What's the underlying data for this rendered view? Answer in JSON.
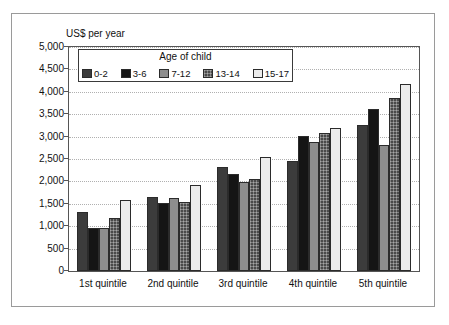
{
  "figure": {
    "axis_title": "US$ per year",
    "legend_title": "Age of child"
  },
  "chart_data": {
    "type": "bar",
    "title": "",
    "xlabel": "",
    "ylabel": "US$ per year",
    "ylim": [
      0,
      5000
    ],
    "ytick_step": 500,
    "grid": true,
    "legend_position": "inside-top-left",
    "legend_title": "Age of child",
    "categories": [
      "1st quintile",
      "2nd quintile",
      "3rd quintile",
      "4th quintile",
      "5th quintile"
    ],
    "ytick_labels": [
      "0",
      "500",
      "1,000",
      "1,500",
      "2,000",
      "2,500",
      "3,000",
      "3,500",
      "4,000",
      "4,500",
      "5,000"
    ],
    "ytick_values": [
      0,
      500,
      1000,
      1500,
      2000,
      2500,
      3000,
      3500,
      4000,
      4500,
      5000
    ],
    "series": [
      {
        "name": "0-2",
        "color": "#3c3c3c",
        "pattern": "solid",
        "values": [
          1320,
          1650,
          2330,
          2460,
          3260
        ]
      },
      {
        "name": "3-6",
        "color": "#151515",
        "pattern": "solid",
        "values": [
          960,
          1510,
          2160,
          3010,
          3620
        ]
      },
      {
        "name": "7-12",
        "color": "#8d8d8d",
        "pattern": "solid",
        "values": [
          960,
          1630,
          1980,
          2870,
          2820
        ]
      },
      {
        "name": "13-14",
        "color": "#4a4a4a",
        "pattern": "checker",
        "values": [
          1180,
          1550,
          2050,
          3090,
          3860
        ]
      },
      {
        "name": "15-17",
        "color": "#ececec",
        "pattern": "solid",
        "values": [
          1580,
          1920,
          2540,
          3190,
          4170
        ]
      }
    ]
  }
}
